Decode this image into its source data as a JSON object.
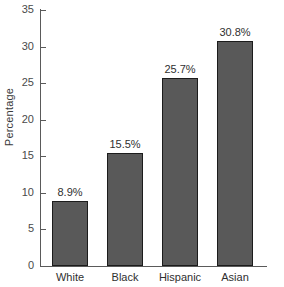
{
  "chart_data": {
    "type": "bar",
    "title": "",
    "xlabel": "",
    "ylabel": "Percentage",
    "categories": [
      "White",
      "Black",
      "Hispanic",
      "Asian"
    ],
    "values": [
      8.9,
      15.5,
      25.7,
      30.8
    ],
    "value_labels": [
      "8.9%",
      "15.5%",
      "25.7%",
      "30.8%"
    ],
    "ylim": [
      0,
      35
    ],
    "yticks": [
      0,
      5,
      10,
      15,
      20,
      25,
      30,
      35
    ],
    "ytick_labels": [
      "0",
      "5",
      "10",
      "15",
      "20",
      "25",
      "30",
      "35"
    ],
    "grid": false,
    "legend": false,
    "bar_color": "#595959",
    "bar_edge_color": "#1c1c1c",
    "axis_color": "#5a5a5a",
    "text_color": "#2f2f2f",
    "background_color": "#ffffff"
  }
}
